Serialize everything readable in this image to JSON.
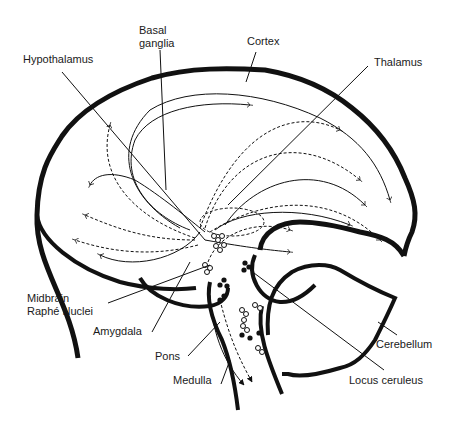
{
  "diagram": {
    "labels": {
      "basal_ganglia_1": "Basal",
      "basal_ganglia_2": "ganglia",
      "cortex": "Cortex",
      "hypothalamus": "Hypothalamus",
      "thalamus": "Thalamus",
      "midbrain_1": "Midbrain",
      "midbrain_2": "Raphé Nuclei",
      "amygdala": "Amygdala",
      "pons": "Pons",
      "medulla": "Medulla",
      "cerebellum": "Cerebellum",
      "locus_ceruleus": "Locus ceruleus"
    },
    "legend": {
      "solid_lines": "projection pathway (solid)",
      "dashed_lines": "projection pathway (dashed)",
      "open_circles": "Raphé neurons",
      "filled_circles": "Locus ceruleus neurons"
    },
    "colors": {
      "ink": "#111111",
      "background": "#ffffff"
    }
  }
}
